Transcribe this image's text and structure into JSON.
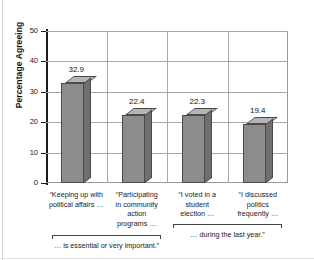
{
  "chart_data": {
    "type": "bar",
    "title": "",
    "subtitle": "",
    "xlabel": "",
    "ylabel": "Percentage Agreeing",
    "ylim": [
      0,
      50
    ],
    "ytick_values": [
      0,
      10,
      20,
      30,
      40,
      50
    ],
    "ytick_labels": [
      "0",
      "10",
      "20",
      "30",
      "40",
      "50"
    ],
    "grid": true,
    "grid_orientation": "both",
    "legend": false,
    "legend_position": "none",
    "categories": [
      "“Keeping up with political affairs …",
      "“Participating in community action programs …",
      "“I voted in a student election …",
      "“I discussed politics frequently …"
    ],
    "category_lines": [
      [
        "“Keeping up with",
        "political affairs …"
      ],
      [
        "“Participating",
        "in community",
        "action",
        "programs …"
      ],
      [
        "“I voted in a",
        "student",
        "election …"
      ],
      [
        "“I discussed",
        "politics",
        "frequently …"
      ]
    ],
    "values": [
      32.9,
      22.4,
      22.3,
      19.4
    ],
    "value_labels": [
      "32.9",
      "22.4",
      "22.3",
      "19.4"
    ],
    "group_brackets": [
      {
        "label": "… is essential or very important.”",
        "categories": [
          0,
          1
        ]
      },
      {
        "label": "… during the last year.”",
        "categories": [
          2,
          3
        ]
      }
    ],
    "colors": {
      "bar_front": "#8c8c8c",
      "bar_side": "#6f6f6f",
      "bar_top": "#b4b4b4",
      "bar_outline": "#4a4a4a",
      "grid": "#a8a8a8",
      "axis": "#1a1a1a",
      "background": "#ffffff",
      "text": "#111111"
    }
  }
}
